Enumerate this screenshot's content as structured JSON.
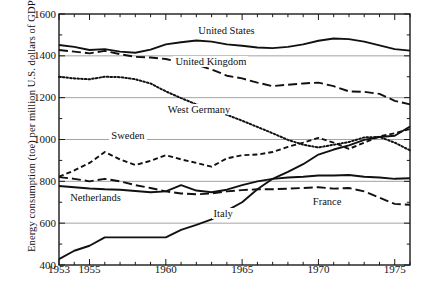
{
  "chart_data": {
    "type": "line",
    "title": "",
    "xlabel": "",
    "ylabel": "Energy consumption (toe) per million U.S. dollars of GDP(1)",
    "ylabel_main": "Energy consumption (toe) per million U.S. dollars of GDP",
    "ylabel_superscript": "(1)",
    "xlim": [
      1953,
      1976
    ],
    "ylim": [
      400,
      1600
    ],
    "yticks": [
      400,
      600,
      800,
      1000,
      1200,
      1400,
      1600
    ],
    "ytick_labels": [
      "400",
      "600",
      "800",
      "1000",
      "1200",
      "1400",
      "1600"
    ],
    "xticks": [
      1953,
      1955,
      1960,
      1965,
      1970,
      1975
    ],
    "xtick_labels": [
      "1953",
      "1955",
      "1960",
      "1965",
      "1970",
      "1975"
    ],
    "xtick_minor_step": 1,
    "grid": "horizontal-major",
    "legend": "inline-annotations",
    "x": [
      1953,
      1954,
      1955,
      1956,
      1957,
      1958,
      1959,
      1960,
      1961,
      1962,
      1963,
      1964,
      1965,
      1966,
      1967,
      1968,
      1969,
      1970,
      1971,
      1972,
      1973,
      1974,
      1975,
      1976
    ],
    "series": [
      {
        "name": "United States",
        "style": "solid",
        "label_x": 1962.0,
        "label_y": 1520,
        "values": [
          1452,
          1443,
          1428,
          1432,
          1420,
          1415,
          1430,
          1455,
          1465,
          1473,
          1468,
          1455,
          1448,
          1440,
          1437,
          1443,
          1455,
          1472,
          1483,
          1480,
          1468,
          1450,
          1432,
          1425
        ]
      },
      {
        "name": "United Kingdom",
        "style": "long-dash",
        "label_x": 1960.5,
        "label_y": 1372,
        "values": [
          1428,
          1420,
          1412,
          1424,
          1408,
          1395,
          1392,
          1385,
          1368,
          1358,
          1335,
          1305,
          1292,
          1272,
          1255,
          1262,
          1268,
          1272,
          1255,
          1230,
          1228,
          1218,
          1185,
          1168
        ]
      },
      {
        "name": "West Germany",
        "style": "dotted",
        "label_x": 1960.0,
        "label_y": 1140,
        "values": [
          1300,
          1292,
          1288,
          1300,
          1298,
          1288,
          1268,
          1230,
          1198,
          1168,
          1145,
          1118,
          1090,
          1060,
          1030,
          998,
          975,
          962,
          975,
          988,
          1010,
          1012,
          985,
          948
        ]
      },
      {
        "name": "Sweden",
        "style": "dashed",
        "label_x": 1956.3,
        "label_y": 1015,
        "values": [
          822,
          852,
          888,
          940,
          905,
          878,
          898,
          925,
          905,
          888,
          870,
          910,
          925,
          928,
          940,
          965,
          985,
          1008,
          985,
          955,
          985,
          1015,
          1030,
          1050
        ]
      },
      {
        "name": "Netherlands",
        "style": "solid",
        "label_x": 1953.6,
        "label_y": 718,
        "values": [
          778,
          772,
          766,
          762,
          760,
          754,
          748,
          752,
          782,
          756,
          748,
          760,
          782,
          800,
          812,
          818,
          822,
          828,
          828,
          830,
          822,
          818,
          812,
          815
        ]
      },
      {
        "name": "France",
        "style": "long-dash",
        "label_x": 1969.5,
        "label_y": 700,
        "values": [
          820,
          812,
          800,
          812,
          800,
          782,
          768,
          752,
          742,
          738,
          742,
          752,
          758,
          762,
          762,
          765,
          768,
          772,
          765,
          768,
          752,
          722,
          692,
          688
        ]
      },
      {
        "name": "Italy",
        "style": "solid",
        "label_x": 1963.0,
        "label_y": 645,
        "values": [
          428,
          468,
          492,
          532,
          532,
          532,
          532,
          532,
          568,
          592,
          618,
          660,
          700,
          762,
          812,
          845,
          882,
          928,
          952,
          972,
          998,
          1012,
          1018,
          1062
        ]
      }
    ]
  }
}
